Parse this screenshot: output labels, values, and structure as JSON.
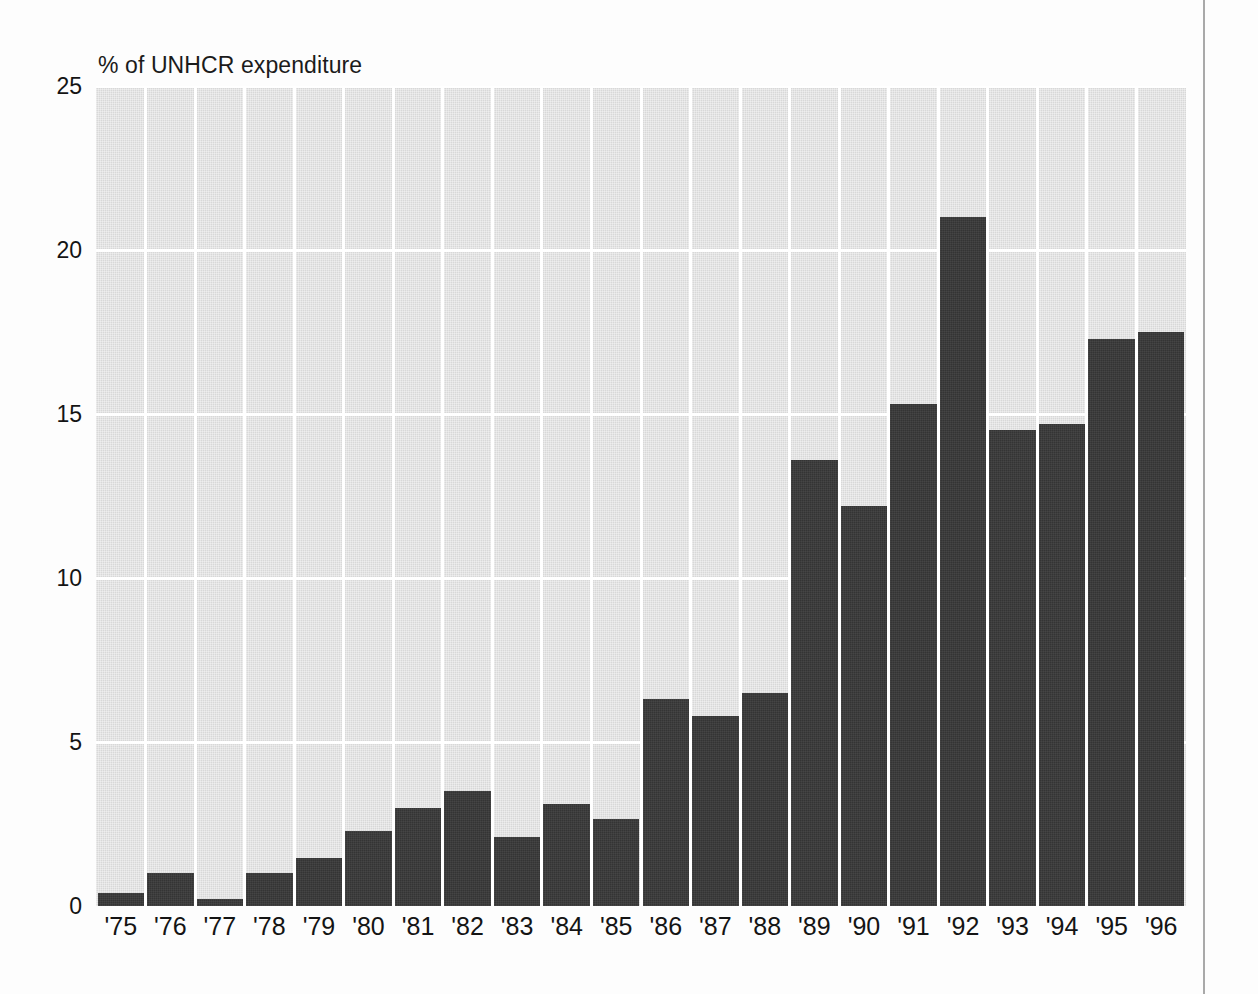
{
  "figure": {
    "title": "% of UNHCR expenditure",
    "axis_rule_color": "#a9a9a9",
    "plot_background_color": "#d8d8d8",
    "bar_color": "#343434",
    "gridline_color": "#ffffff"
  },
  "chart_data": {
    "type": "bar",
    "title": "% of UNHCR expenditure",
    "xlabel": "",
    "ylabel": "% of UNHCR expenditure",
    "ylim": [
      0,
      25
    ],
    "yticks": [
      0,
      5,
      10,
      15,
      20,
      25
    ],
    "grid": true,
    "legend": null,
    "categories": [
      "'75",
      "'76",
      "'77",
      "'78",
      "'79",
      "'80",
      "'81",
      "'82",
      "'83",
      "'84",
      "'85",
      "'86",
      "'87",
      "'88",
      "'89",
      "'90",
      "'91",
      "'92",
      "'93",
      "'94",
      "'95",
      "'96"
    ],
    "values": [
      0.4,
      1.0,
      0.2,
      1.0,
      1.45,
      2.3,
      3.0,
      3.5,
      2.1,
      3.1,
      2.65,
      6.3,
      5.8,
      6.5,
      13.6,
      12.2,
      15.3,
      21.0,
      14.5,
      14.7,
      17.3,
      17.5
    ]
  }
}
